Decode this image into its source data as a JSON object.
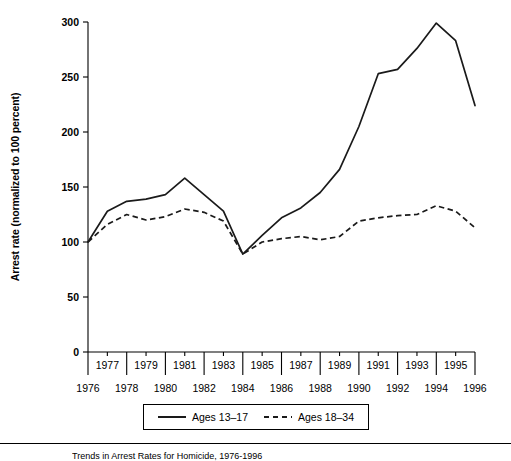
{
  "figure": {
    "caption": "Trends in Arrest Rates for Homicide, 1976-1996"
  },
  "axes": {
    "y_title": "Arrest rate (normalized to 100 percent)",
    "y_ticks": [
      "0",
      "50",
      "100",
      "150",
      "200",
      "250",
      "300"
    ],
    "x_ticks_upper": [
      "1977",
      "1979",
      "1981",
      "1983",
      "1985",
      "1987",
      "1989",
      "1991",
      "1993",
      "1995"
    ],
    "x_ticks_lower": [
      "1976",
      "1978",
      "1980",
      "1982",
      "1984",
      "1986",
      "1988",
      "1990",
      "1992",
      "1994",
      "1996"
    ]
  },
  "legend": {
    "entries": [
      {
        "label": "Ages 13–17",
        "style": "solid"
      },
      {
        "label": "Ages 18–34",
        "style": "dashed"
      }
    ]
  },
  "chart_data": {
    "type": "line",
    "title": "",
    "xlabel": "",
    "ylabel": "Arrest rate (normalized to 100 percent)",
    "xlim": [
      1976,
      1996
    ],
    "ylim": [
      0,
      300
    ],
    "ytick_step": 50,
    "grid": false,
    "legend_position": "bottom-center",
    "x": [
      1976,
      1977,
      1978,
      1979,
      1980,
      1981,
      1982,
      1983,
      1984,
      1985,
      1986,
      1987,
      1988,
      1989,
      1990,
      1991,
      1992,
      1993,
      1994,
      1995,
      1996
    ],
    "series": [
      {
        "name": "Ages 13–17",
        "style": "solid",
        "values": [
          100,
          128,
          137,
          139,
          143,
          158,
          143,
          128,
          89,
          106,
          122,
          131,
          145,
          166,
          205,
          253,
          257,
          276,
          299,
          283,
          224
        ]
      },
      {
        "name": "Ages 18–34",
        "style": "dashed",
        "values": [
          100,
          116,
          125,
          120,
          123,
          130,
          127,
          119,
          89,
          100,
          103,
          105,
          102,
          105,
          119,
          122,
          124,
          125,
          133,
          128,
          113
        ]
      }
    ]
  }
}
